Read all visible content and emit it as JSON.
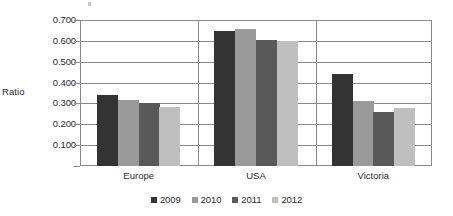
{
  "chart_data": {
    "type": "bar",
    "title": "",
    "xlabel": "",
    "ylabel": "Ratio",
    "categories": [
      "Europe",
      "USA",
      "Victoria"
    ],
    "series": [
      {
        "name": "2009",
        "color": "#333333",
        "values": [
          0.34,
          0.645,
          0.44
        ]
      },
      {
        "name": "2010",
        "color": "#9a9a9a",
        "values": [
          0.318,
          0.655,
          0.31
        ]
      },
      {
        "name": "2011",
        "color": "#595959",
        "values": [
          0.3,
          0.605,
          0.258
        ]
      },
      {
        "name": "2012",
        "color": "#bfbfbf",
        "values": [
          0.285,
          0.6,
          0.28
        ]
      }
    ],
    "ylim": [
      0,
      0.7
    ],
    "ytick_values": [
      0.7,
      0.6,
      0.5,
      0.4,
      0.3,
      0.2,
      0.1,
      0
    ],
    "ytick_labels": [
      "0.700",
      "0.600",
      "0.500",
      "0.400",
      "0.300",
      "0.200",
      "0.100",
      "-"
    ],
    "grid": "horizontal",
    "legend_position": "bottom-center",
    "group_dividers": true
  },
  "colors": {
    "axis": "#8a8a8a",
    "grid": "#8a8a8a",
    "text": "#2b2b2b",
    "background": "#ffffff"
  }
}
